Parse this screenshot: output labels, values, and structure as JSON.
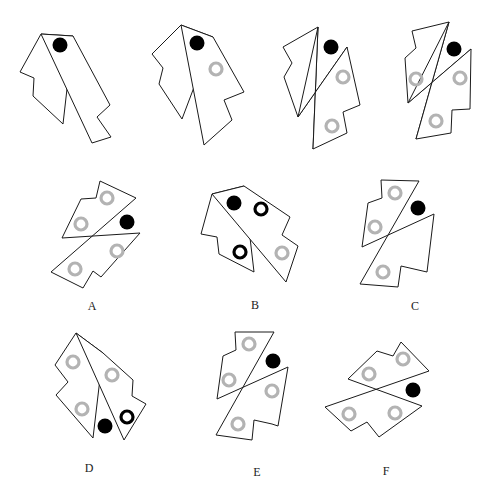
{
  "puzzle": {
    "sequence_figures": [
      {
        "id": "q1",
        "pieces": [
          [
            [
              41,
              34
            ],
            [
              20,
              72
            ],
            [
              34,
              78
            ],
            [
              33,
              96
            ],
            [
              63,
              124
            ],
            [
              73,
              36
            ]
          ],
          [
            [
              73,
              36
            ],
            [
              110,
              105
            ],
            [
              97,
              117
            ],
            [
              111,
              137
            ],
            [
              92,
              143
            ],
            [
              41,
              34
            ]
          ]
        ],
        "dots": [
          [
            60,
            45
          ]
        ],
        "gray_rings": [],
        "black_rings": []
      },
      {
        "id": "q2",
        "pieces": [
          [
            [
              181,
              25
            ],
            [
              152,
              54
            ],
            [
              163,
              68
            ],
            [
              159,
              84
            ],
            [
              182,
              119
            ],
            [
              213,
              37
            ]
          ],
          [
            [
              213,
              37
            ],
            [
              244,
              92
            ],
            [
              224,
              100
            ],
            [
              232,
              120
            ],
            [
              204,
              145
            ],
            [
              181,
              25
            ]
          ]
        ],
        "dots": [
          [
            197,
            43
          ]
        ],
        "gray_rings": [
          [
            216,
            69
          ]
        ],
        "black_rings": []
      },
      {
        "id": "q3",
        "pieces": [
          [
            [
              283,
              47
            ],
            [
              318,
              27
            ],
            [
              313,
              149
            ],
            [
              347,
              133
            ],
            [
              343,
              112
            ],
            [
              360,
              105
            ],
            [
              347,
              47
            ],
            [
              298,
              117
            ],
            [
              284,
              77
            ],
            [
              292,
              63
            ]
          ]
        ],
        "split": true,
        "dots": [
          [
            331,
            47
          ]
        ],
        "gray_rings": [
          [
            343,
            77
          ],
          [
            332,
            126
          ]
        ],
        "black_rings": []
      },
      {
        "id": "q4",
        "pieces": [],
        "split": true,
        "dots": [
          [
            454,
            49
          ]
        ],
        "gray_rings": [
          [
            416,
            79
          ],
          [
            460,
            78
          ],
          [
            436,
            121
          ]
        ],
        "black_rings": []
      }
    ],
    "options": [
      {
        "label": "A",
        "label_pos": [
          92,
          306
        ],
        "dots": [
          [
            127,
            222
          ]
        ],
        "gray_rings": [
          [
            107,
            198
          ],
          [
            81,
            224
          ],
          [
            117,
            251
          ],
          [
            75,
            269
          ]
        ],
        "black_rings": []
      },
      {
        "label": "B",
        "label_pos": [
          255,
          305
        ],
        "dots": [
          [
            234,
            203
          ]
        ],
        "gray_rings": [
          [
            282,
            253
          ]
        ],
        "black_rings": [
          [
            261,
            209
          ],
          [
            240,
            252
          ]
        ]
      },
      {
        "label": "C",
        "label_pos": [
          415,
          306
        ],
        "dots": [
          [
            418,
            208
          ]
        ],
        "gray_rings": [
          [
            395,
            193
          ],
          [
            375,
            227
          ],
          [
            383,
            272
          ]
        ],
        "black_rings": []
      },
      {
        "label": "D",
        "label_pos": [
          89,
          468
        ],
        "dots": [
          [
            105,
            426
          ]
        ],
        "gray_rings": [
          [
            73,
            362
          ],
          [
            112,
            375
          ],
          [
            82,
            409
          ]
        ],
        "black_rings": [
          [
            127,
            417
          ]
        ]
      },
      {
        "label": "E",
        "label_pos": [
          257,
          472
        ],
        "dots": [
          [
            273,
            361
          ]
        ],
        "gray_rings": [
          [
            249,
            344
          ],
          [
            229,
            380
          ],
          [
            272,
            391
          ],
          [
            238,
            424
          ]
        ],
        "black_rings": []
      },
      {
        "label": "F",
        "label_pos": [
          386,
          471
        ],
        "dots": [
          [
            413,
            390
          ]
        ],
        "gray_rings": [
          [
            403,
            359
          ],
          [
            369,
            374
          ],
          [
            349,
            414
          ],
          [
            395,
            413
          ]
        ],
        "black_rings": []
      }
    ]
  },
  "colors": {
    "outline": "#1a1a1a",
    "dot": "#000000",
    "gray_ring": "#b3b3b3",
    "black_ring": "#000000"
  }
}
